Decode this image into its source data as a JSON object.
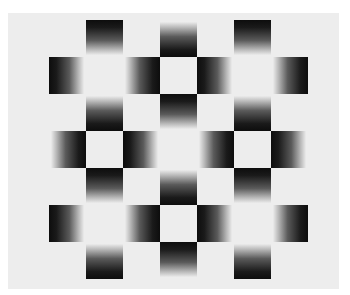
{
  "figure": {
    "title": "",
    "colors": {
      "page_background": "#ffffff",
      "panel_background": "#ededed",
      "dark": "#0d0d0d"
    },
    "grid": {
      "rows": 7,
      "cols": 7,
      "cell_size_px": 37,
      "origin_px": [
        49,
        20
      ],
      "cells": [
        {
          "row": 0,
          "col": 1,
          "dark_side": "top"
        },
        {
          "row": 0,
          "col": 3,
          "dark_side": "bottom"
        },
        {
          "row": 0,
          "col": 5,
          "dark_side": "top"
        },
        {
          "row": 1,
          "col": 0,
          "dark_side": "left"
        },
        {
          "row": 1,
          "col": 2,
          "dark_side": "right"
        },
        {
          "row": 1,
          "col": 4,
          "dark_side": "left"
        },
        {
          "row": 1,
          "col": 6,
          "dark_side": "right"
        },
        {
          "row": 2,
          "col": 1,
          "dark_side": "bottom"
        },
        {
          "row": 2,
          "col": 3,
          "dark_side": "top"
        },
        {
          "row": 2,
          "col": 5,
          "dark_side": "bottom"
        },
        {
          "row": 3,
          "col": 0,
          "dark_side": "right"
        },
        {
          "row": 3,
          "col": 2,
          "dark_side": "left"
        },
        {
          "row": 3,
          "col": 4,
          "dark_side": "right"
        },
        {
          "row": 3,
          "col": 6,
          "dark_side": "left"
        },
        {
          "row": 4,
          "col": 1,
          "dark_side": "top"
        },
        {
          "row": 4,
          "col": 3,
          "dark_side": "bottom"
        },
        {
          "row": 4,
          "col": 5,
          "dark_side": "top"
        },
        {
          "row": 5,
          "col": 0,
          "dark_side": "left"
        },
        {
          "row": 5,
          "col": 2,
          "dark_side": "right"
        },
        {
          "row": 5,
          "col": 4,
          "dark_side": "left"
        },
        {
          "row": 5,
          "col": 6,
          "dark_side": "right"
        },
        {
          "row": 6,
          "col": 1,
          "dark_side": "bottom"
        },
        {
          "row": 6,
          "col": 3,
          "dark_side": "top"
        },
        {
          "row": 6,
          "col": 5,
          "dark_side": "bottom"
        }
      ]
    }
  }
}
